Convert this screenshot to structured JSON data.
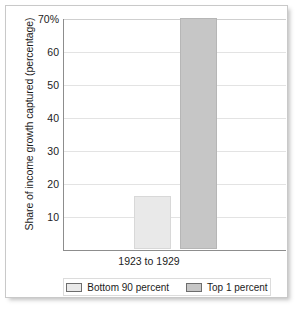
{
  "chart_data": {
    "type": "bar",
    "title": "",
    "subtitle": "",
    "xlabel": "",
    "ylabel": "Share of income growth captured (percentage)",
    "categories": [
      "1923 to 1929"
    ],
    "series": [
      {
        "name": "Bottom 90 percent",
        "values": [
          16
        ],
        "color": "#e9e9e9"
      },
      {
        "name": "Top 1 percent",
        "values": [
          70
        ],
        "color": "#c6c6c6"
      }
    ],
    "ylim": [
      0,
      70
    ],
    "yticks": [
      70,
      60,
      50,
      40,
      30,
      20,
      10
    ],
    "ytick_labels": [
      "70%",
      "60",
      "50",
      "40",
      "30",
      "20",
      "10"
    ],
    "grid": true,
    "legend_position": "bottom"
  },
  "colors": {
    "gridline": "#e3e3e3",
    "axis": "#8d8d8d",
    "text": "#1c1c1c",
    "card_border": "#c9c9c9"
  }
}
